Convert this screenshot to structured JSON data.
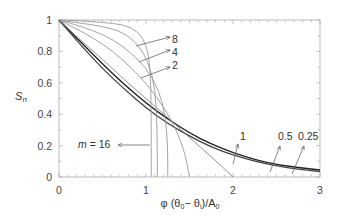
{
  "chart_data": {
    "type": "line",
    "title": "",
    "xlabel": "φ (θ0 − θi)/A0",
    "ylabel": "Sn",
    "xlim": [
      0,
      3
    ],
    "ylim": [
      0,
      1
    ],
    "x_ticks": [
      "0",
      "1",
      "2",
      "3"
    ],
    "y_ticks": [
      "0",
      "0.2",
      "0.4",
      "0.6",
      "0.8",
      "1"
    ],
    "grid": false,
    "series": [
      {
        "name": "0.25",
        "points": [
          [
            0,
            1
          ],
          [
            0.25,
            0.86
          ],
          [
            0.5,
            0.72
          ],
          [
            0.75,
            0.59
          ],
          [
            1,
            0.47
          ],
          [
            1.25,
            0.37
          ],
          [
            1.5,
            0.28
          ],
          [
            1.75,
            0.21
          ],
          [
            2,
            0.155
          ],
          [
            2.25,
            0.11
          ],
          [
            2.5,
            0.08
          ],
          [
            2.75,
            0.06
          ],
          [
            3,
            0.045
          ]
        ]
      },
      {
        "name": "0.5",
        "points": [
          [
            0,
            1
          ],
          [
            0.25,
            0.84
          ],
          [
            0.5,
            0.69
          ],
          [
            0.75,
            0.56
          ],
          [
            1,
            0.44
          ],
          [
            1.25,
            0.34
          ],
          [
            1.5,
            0.26
          ],
          [
            1.75,
            0.19
          ],
          [
            2,
            0.14
          ],
          [
            2.25,
            0.1
          ],
          [
            2.5,
            0.07
          ],
          [
            2.75,
            0.05
          ],
          [
            3,
            0.035
          ]
        ]
      },
      {
        "name": "1",
        "points": [
          [
            0,
            1
          ],
          [
            0.25,
            0.87
          ],
          [
            0.5,
            0.75
          ],
          [
            0.75,
            0.62
          ],
          [
            1,
            0.5
          ],
          [
            1.25,
            0.38
          ],
          [
            1.5,
            0.25
          ],
          [
            1.75,
            0.13
          ],
          [
            2,
            0
          ]
        ]
      },
      {
        "name": "2",
        "points": [
          [
            0,
            1
          ],
          [
            0.25,
            0.93
          ],
          [
            0.5,
            0.85
          ],
          [
            0.75,
            0.74
          ],
          [
            1,
            0.6
          ],
          [
            1.2,
            0.45
          ],
          [
            1.35,
            0.3
          ],
          [
            1.45,
            0.15
          ],
          [
            1.5,
            0
          ]
        ]
      },
      {
        "name": "4",
        "points": [
          [
            0,
            1
          ],
          [
            0.25,
            0.96
          ],
          [
            0.5,
            0.91
          ],
          [
            0.75,
            0.83
          ],
          [
            1,
            0.7
          ],
          [
            1.15,
            0.55
          ],
          [
            1.22,
            0.4
          ],
          [
            1.25,
            0.2
          ],
          [
            1.25,
            0
          ]
        ]
      },
      {
        "name": "8",
        "points": [
          [
            0,
            1
          ],
          [
            0.25,
            0.98
          ],
          [
            0.5,
            0.96
          ],
          [
            0.75,
            0.92
          ],
          [
            0.95,
            0.82
          ],
          [
            1.08,
            0.65
          ],
          [
            1.12,
            0.45
          ],
          [
            1.13,
            0.2
          ],
          [
            1.13,
            0
          ]
        ]
      },
      {
        "name": "16",
        "points": [
          [
            0,
            1
          ],
          [
            0.25,
            0.995
          ],
          [
            0.5,
            0.985
          ],
          [
            0.75,
            0.97
          ],
          [
            0.9,
            0.93
          ],
          [
            1.0,
            0.85
          ],
          [
            1.05,
            0.7
          ],
          [
            1.06,
            0.4
          ],
          [
            1.06,
            0
          ]
        ]
      }
    ],
    "annotations": [
      {
        "text": "8",
        "target_series": "8"
      },
      {
        "text": "4",
        "target_series": "4"
      },
      {
        "text": "2",
        "target_series": "2"
      },
      {
        "text": "1",
        "target_series": "1"
      },
      {
        "text": "0.5",
        "target_series": "0.5"
      },
      {
        "text": "0.25",
        "target_series": "0.25"
      },
      {
        "text": "m = 16",
        "target_series": "16"
      }
    ],
    "legend": "none"
  }
}
